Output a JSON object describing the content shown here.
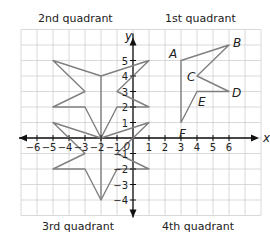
{
  "quadrant_labels": {
    "q2": "2nd quadrant",
    "q1": "1st quadrant",
    "q3": "3rd quadrant",
    "q4": "4th quadrant"
  },
  "axes": {
    "x_label": "x",
    "y_label": "y",
    "x_ticks": [
      -6,
      -5,
      -4,
      -3,
      -2,
      -1,
      1,
      2,
      3,
      4,
      5,
      6
    ],
    "y_ticks": [
      -4,
      -3,
      -2,
      -1,
      1,
      2,
      3,
      4,
      5
    ],
    "origin_label": "0",
    "grid_x_range": [
      -7,
      8
    ],
    "grid_y_range": [
      -5,
      7
    ]
  },
  "colors": {
    "grid": "#cfcfcf",
    "axis": "#111111",
    "shape": "#808080",
    "label": "#222222"
  },
  "shapes": [
    {
      "name": "star-upper-half",
      "points": [
        [
          -2,
          4
        ],
        [
          1,
          5
        ],
        [
          -1,
          3
        ],
        [
          1,
          2
        ],
        [
          -1,
          2
        ],
        [
          -2,
          0
        ],
        [
          -3,
          2
        ],
        [
          -5,
          2
        ],
        [
          -3,
          3
        ],
        [
          -5,
          5
        ]
      ],
      "closed": true
    },
    {
      "name": "star-lower-half",
      "points": [
        [
          -2,
          0
        ],
        [
          1,
          1
        ],
        [
          -1,
          -1
        ],
        [
          1,
          -2
        ],
        [
          -1,
          -2
        ],
        [
          -2,
          -4
        ],
        [
          -3,
          -2
        ],
        [
          -5,
          -2
        ],
        [
          -3,
          -1
        ],
        [
          -5,
          1
        ]
      ],
      "closed": true
    },
    {
      "name": "star-center-line",
      "points": [
        [
          -2,
          4
        ],
        [
          -2,
          -4
        ]
      ],
      "closed": false
    },
    {
      "name": "polygon-ABCDEF",
      "points": [
        [
          3,
          5
        ],
        [
          6,
          6
        ],
        [
          4,
          4
        ],
        [
          6,
          3
        ],
        [
          4,
          3
        ],
        [
          3,
          1
        ]
      ],
      "closed": true
    }
  ],
  "vertex_labels": [
    {
      "text": "A",
      "x": 3,
      "y": 5,
      "dx": -12,
      "dy": -3
    },
    {
      "text": "B",
      "x": 6,
      "y": 6,
      "dx": 4,
      "dy": 2
    },
    {
      "text": "C",
      "x": 4,
      "y": 4,
      "dx": -10,
      "dy": 5
    },
    {
      "text": "D",
      "x": 6,
      "y": 3,
      "dx": 3,
      "dy": 5
    },
    {
      "text": "E",
      "x": 4,
      "y": 3,
      "dx": 1,
      "dy": 14
    },
    {
      "text": "F",
      "x": 3,
      "y": 1,
      "dx": -2,
      "dy": 15
    }
  ]
}
